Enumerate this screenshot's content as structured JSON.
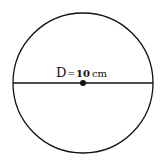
{
  "diagram": {
    "type": "circle-with-diameter",
    "label": "D = 10 cm",
    "label_parts": {
      "symbol": "D",
      "equals": "=",
      "value": "10",
      "unit": "cm"
    },
    "circle": {
      "cx": 83,
      "cy": 83,
      "r": 70
    },
    "diameter_line": {
      "x1": 13,
      "y1": 83,
      "x2": 153,
      "y2": 83
    },
    "center_point": {
      "cx": 83,
      "cy": 83,
      "r": 3
    },
    "colors": {
      "stroke": "#111111",
      "background": "#ffffff"
    }
  }
}
